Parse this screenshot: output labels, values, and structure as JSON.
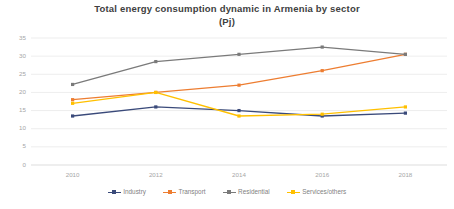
{
  "chart_data": {
    "type": "line",
    "title": "Total energy consumption dynamic in Armenia by sector",
    "subtitle": "(Pj)",
    "title_line1": "Total energy consumption dynamic in Armenia by sector",
    "title_line2": "(Pj)",
    "xlabel": "",
    "ylabel": "",
    "categories": [
      "2010",
      "2012",
      "2014",
      "2016",
      "2018"
    ],
    "x": [
      2010,
      2012,
      2014,
      2016,
      2018
    ],
    "ylim": [
      0,
      35
    ],
    "ytick_labels": [
      "0",
      "5",
      "10",
      "15",
      "20",
      "25",
      "30",
      "35"
    ],
    "yticks": [
      0,
      5,
      10,
      15,
      20,
      25,
      30,
      35
    ],
    "grid": true,
    "legend_position": "bottom",
    "marker": "square",
    "series": [
      {
        "name": "Industry",
        "color": "#3a4a7a",
        "values": [
          13.5,
          16.0,
          15.0,
          13.5,
          14.3
        ]
      },
      {
        "name": "Transport",
        "color": "#ed7d31",
        "values": [
          18.0,
          20.0,
          22.0,
          26.0,
          30.5
        ]
      },
      {
        "name": "Residential",
        "color": "#7a7a7a",
        "values": [
          22.2,
          28.5,
          30.5,
          32.5,
          30.5
        ]
      },
      {
        "name": "Services/others",
        "color": "#ffc000",
        "values": [
          17.0,
          20.0,
          13.5,
          14.0,
          16.0
        ]
      }
    ]
  },
  "colors": {
    "industry": "#3a4a7a",
    "transport": "#ed7d31",
    "residential": "#7a7a7a",
    "services": "#ffc000",
    "gridline": "#e8e8e8",
    "tick_text": "#a6a6a6",
    "title_text": "#404040",
    "legend_text": "#7f7f7f",
    "background": "#ffffff"
  }
}
